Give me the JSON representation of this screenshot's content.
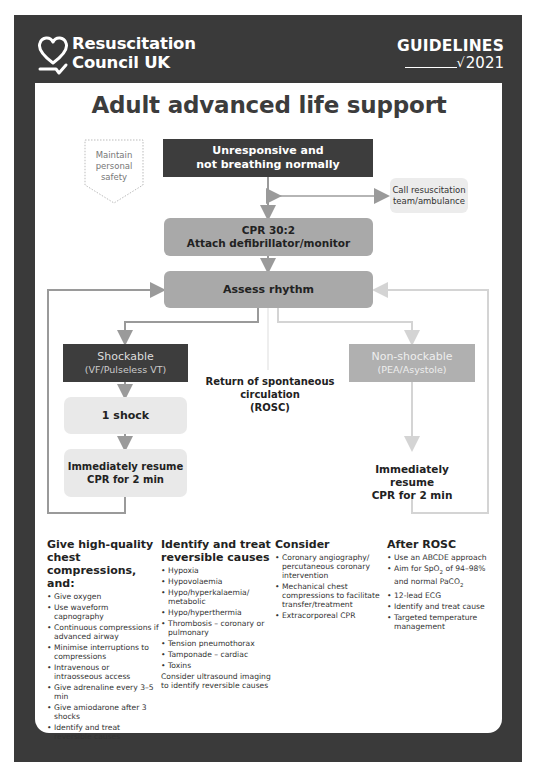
{
  "header": {
    "org_line1": "Resuscitation",
    "org_line2": "Council UK",
    "guidelines_label": "GUIDELINES",
    "guidelines_year": "2021"
  },
  "title": "Adult advanced life support",
  "flow": {
    "safety": [
      "Maintain",
      "personal",
      "safety"
    ],
    "unresponsive": [
      "Unresponsive and",
      "not breathing normally"
    ],
    "call": [
      "Call resuscitation",
      "team/ambulance"
    ],
    "cpr": [
      "CPR 30:2",
      "Attach defibrillator/monitor"
    ],
    "assess": "Assess rhythm",
    "shockable": [
      "Shockable",
      "(VF/Pulseless VT)"
    ],
    "non_shockable": [
      "Non-shockable",
      "(PEA/Asystole)"
    ],
    "rosc": [
      "Return of spontaneous",
      "circulation",
      "(ROSC)"
    ],
    "shock": "1 shock",
    "resume_left": [
      "Immediately resume",
      "CPR for 2 min"
    ],
    "resume_right": [
      "Immediately resume",
      "CPR for 2 min"
    ]
  },
  "columns": [
    {
      "heading": "Give high-quality chest compressions, and:",
      "items": [
        "Give oxygen",
        "Use waveform capnography",
        "Continuous compressions if advanced airway",
        "Minimise interruptions to compressions",
        "Intravenous or intraosseous access",
        "Give adrenaline every 3–5 min",
        "Give amiodarone after 3 shocks",
        "Identify and treat reversible causes"
      ]
    },
    {
      "heading": "Identify and treat reversible causes",
      "items": [
        "Hypoxia",
        "Hypovolaemia",
        "Hypo/hyperkalaemia/ metabolic",
        "Hypo/hyperthermia",
        "Thrombosis – coronary or pulmonary",
        "Tension pneumothorax",
        "Tamponade – cardiac",
        "Toxins"
      ],
      "note": "Consider ultrasound imaging to identify reversible causes"
    },
    {
      "heading": "Consider",
      "items": [
        "Coronary angiography/ percutaneous coronary intervention",
        "Mechanical chest compressions to facilitate transfer/treatment",
        "Extracorporeal CPR"
      ]
    },
    {
      "heading": "After ROSC",
      "items": [
        "Use an ABCDE approach",
        "Aim for SpO2 of 94–98% and normal PaCO2",
        "12-lead ECG",
        "Identify and treat cause",
        "Targeted temperature management"
      ]
    }
  ],
  "colors": {
    "frame": "#3a3a3a",
    "dark_box": "#3d3d3d",
    "mid_box": "#a9a9a9",
    "light_box": "#e9e9e9",
    "non_shockable_box": "#b0b0b0",
    "arrow_dark": "#9a9a9a",
    "arrow_light": "#d4d4d4"
  }
}
